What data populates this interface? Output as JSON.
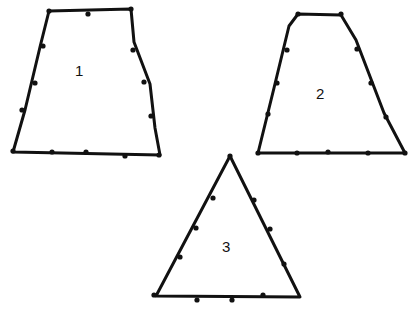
{
  "diagram": {
    "shapes": [
      {
        "id": 1,
        "label": "1",
        "kind": "trapezoid",
        "points": [
          [
            49,
            11
          ],
          [
            131,
            9
          ],
          [
            134,
            42
          ],
          [
            150,
            84
          ],
          [
            155,
            128
          ],
          [
            160,
            155
          ],
          [
            13,
            152
          ],
          [
            25,
            110
          ],
          [
            40,
            47
          ]
        ],
        "dots": [
          [
            49,
            11
          ],
          [
            88,
            14
          ],
          [
            131,
            9
          ],
          [
            133,
            50
          ],
          [
            144,
            82
          ],
          [
            151,
            116
          ],
          [
            159,
            155
          ],
          [
            125,
            156
          ],
          [
            86,
            152
          ],
          [
            52,
            152
          ],
          [
            13,
            151
          ],
          [
            22,
            110
          ],
          [
            35,
            83
          ],
          [
            43,
            46
          ]
        ],
        "label_pos": [
          75,
          62
        ]
      },
      {
        "id": 2,
        "label": "2",
        "kind": "trapezoid",
        "points": [
          [
            298,
            14
          ],
          [
            341,
            15
          ],
          [
            356,
            40
          ],
          [
            384,
            113
          ],
          [
            405,
            153
          ],
          [
            258,
            153
          ],
          [
            274,
            88
          ],
          [
            289,
            26
          ]
        ],
        "dots": [
          [
            298,
            14
          ],
          [
            341,
            14
          ],
          [
            357,
            49
          ],
          [
            371,
            83
          ],
          [
            386,
            117
          ],
          [
            405,
            153
          ],
          [
            368,
            153
          ],
          [
            328,
            152
          ],
          [
            297,
            153
          ],
          [
            258,
            153
          ],
          [
            268,
            114
          ],
          [
            277,
            83
          ],
          [
            287,
            50
          ]
        ],
        "label_pos": [
          316,
          85
        ]
      },
      {
        "id": 3,
        "label": "3",
        "kind": "triangle",
        "points": [
          [
            230,
            156
          ],
          [
            300,
            297
          ],
          [
            156,
            296
          ]
        ],
        "dots": [
          [
            230,
            156
          ],
          [
            254,
            200
          ],
          [
            270,
            229
          ],
          [
            284,
            264
          ],
          [
            263,
            295
          ],
          [
            232,
            300
          ],
          [
            197,
            300
          ],
          [
            154,
            295
          ],
          [
            180,
            257
          ],
          [
            196,
            228
          ],
          [
            213,
            198
          ]
        ],
        "label_pos": [
          222,
          238
        ]
      }
    ]
  }
}
